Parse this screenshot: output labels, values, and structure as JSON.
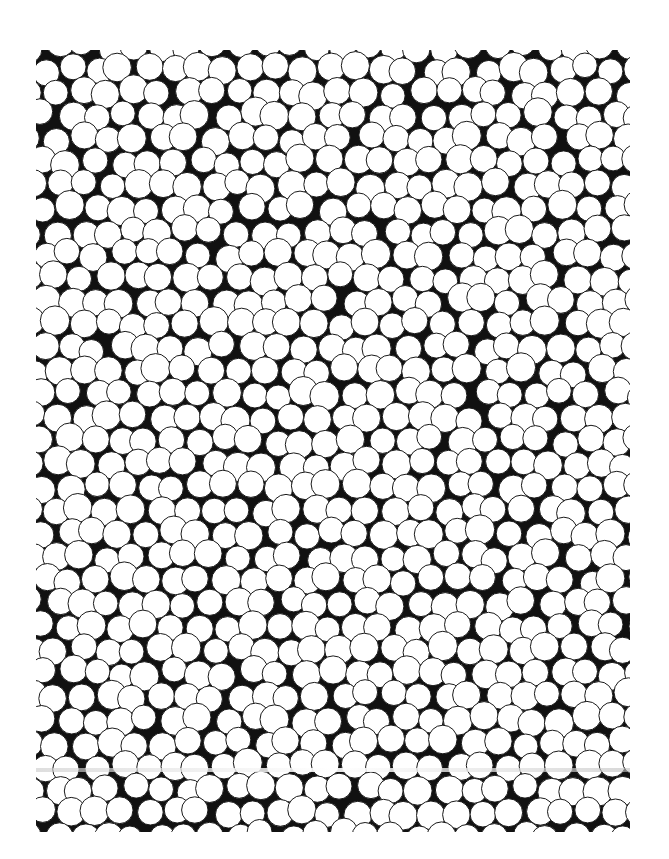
{
  "image": {
    "description": "Dense random packing of white circles on a black background (scanned halftone)",
    "frame": {
      "x": 36,
      "y": 50,
      "width": 594,
      "height": 782
    },
    "background_color": "#111111",
    "circle_fill": "#ffffff",
    "circle_stroke": "#1a1a1a",
    "circle_radius": 13.5,
    "radius_jitter": 1.2,
    "seed": 7,
    "scan_streak_y": 768
  }
}
